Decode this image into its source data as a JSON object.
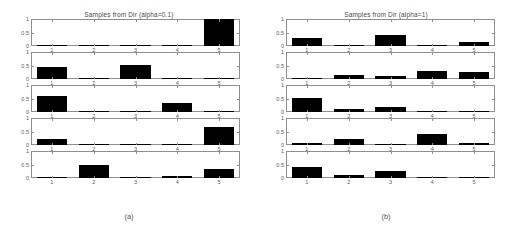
{
  "figure": {
    "caption_a": "(a)",
    "caption_b": "(b)"
  },
  "chart_data": [
    {
      "type": "bar",
      "title": "Samples from Dir (alpha=0.1)",
      "caption": "(a)",
      "panel": "a",
      "xlabel": "",
      "ylabel": "",
      "categories": [
        "1",
        "2",
        "3",
        "4",
        "5"
      ],
      "xticklabels": [
        "1",
        "2",
        "3",
        "4",
        "5"
      ],
      "yticklabels": [
        "0",
        "0.5",
        "1"
      ],
      "ylim": [
        0,
        1
      ],
      "yticks": [
        0,
        0.5,
        1
      ],
      "grid": false,
      "legend": null,
      "bar_color": "#000000",
      "subplots": [
        {
          "index": 1,
          "values": [
            0.002,
            0.001,
            0.003,
            0.001,
            0.993
          ]
        },
        {
          "index": 2,
          "values": [
            0.45,
            0.005,
            0.52,
            0.012,
            0.013
          ]
        },
        {
          "index": 3,
          "values": [
            0.58,
            0.03,
            0.004,
            0.33,
            0.056
          ]
        },
        {
          "index": 4,
          "values": [
            0.22,
            0.003,
            0.015,
            0.005,
            0.667
          ]
        },
        {
          "index": 5,
          "values": [
            0.007,
            0.47,
            0.005,
            0.06,
            0.35
          ]
        }
      ]
    },
    {
      "type": "bar",
      "title": "Samples from Dir (alpha=1)",
      "caption": "(b)",
      "panel": "b",
      "xlabel": "",
      "ylabel": "",
      "categories": [
        "1",
        "2",
        "3",
        "4",
        "5"
      ],
      "xticklabels": [
        "1",
        "2",
        "3",
        "4",
        "5"
      ],
      "yticklabels": [
        "0",
        "0.5",
        "1"
      ],
      "ylim": [
        0,
        1
      ],
      "yticks": [
        0,
        0.5,
        1
      ],
      "grid": false,
      "legend": null,
      "bar_color": "#000000",
      "subplots": [
        {
          "index": 1,
          "values": [
            0.3,
            0.015,
            0.4,
            0.02,
            0.15
          ]
        },
        {
          "index": 2,
          "values": [
            0.03,
            0.15,
            0.13,
            0.3,
            0.25
          ]
        },
        {
          "index": 3,
          "values": [
            0.52,
            0.12,
            0.18,
            0.03,
            0.006
          ]
        },
        {
          "index": 4,
          "values": [
            0.08,
            0.22,
            0.012,
            0.42,
            0.09
          ]
        },
        {
          "index": 5,
          "values": [
            0.4,
            0.11,
            0.25,
            0.05,
            0.02
          ]
        }
      ]
    }
  ]
}
